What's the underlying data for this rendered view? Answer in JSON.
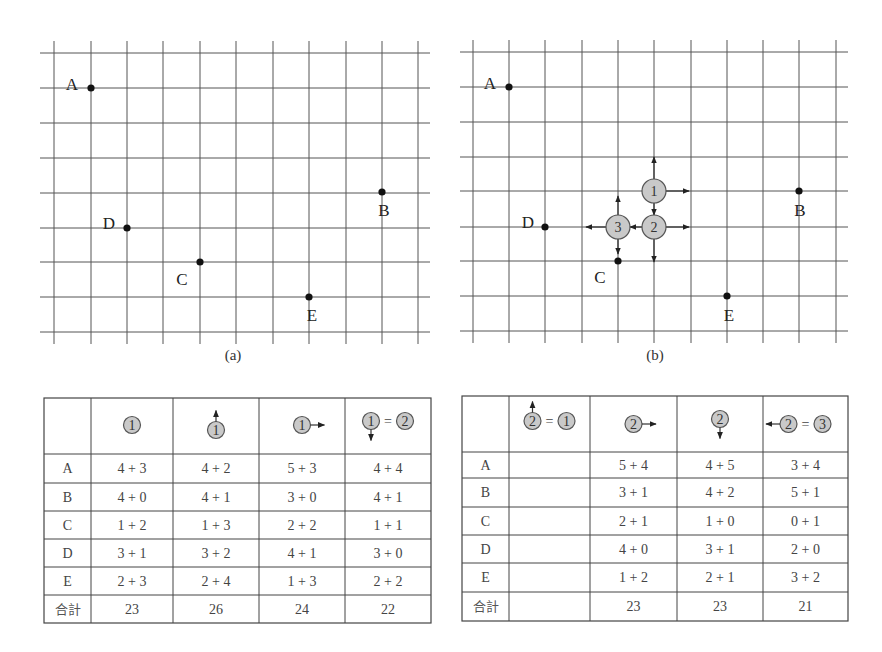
{
  "figure_a": {
    "caption": "(a)",
    "grid": {
      "x_lines": [
        54,
        91,
        127,
        163,
        200,
        236,
        273,
        309,
        346,
        382,
        418
      ],
      "y_lines": [
        53,
        88,
        123,
        158,
        193,
        228,
        262,
        297,
        332
      ],
      "x_start": 40,
      "x_end": 430,
      "y_start": 41,
      "y_end": 344
    },
    "points": [
      {
        "label": "A",
        "x": 91,
        "y": 88,
        "lx": -19,
        "ly": -4
      },
      {
        "label": "B",
        "x": 382,
        "y": 192,
        "lx": 2,
        "ly": 18
      },
      {
        "label": "C",
        "x": 200,
        "y": 262,
        "lx": -18,
        "ly": 17
      },
      {
        "label": "D",
        "x": 127,
        "y": 228,
        "lx": -18,
        "ly": -5
      },
      {
        "label": "E",
        "x": 309,
        "y": 297,
        "lx": 3,
        "ly": 18
      }
    ]
  },
  "figure_b": {
    "caption": "(b)",
    "grid": {
      "x_lines": [
        473,
        509,
        545,
        582,
        618,
        654,
        691,
        727,
        763,
        799,
        836
      ],
      "y_lines": [
        52,
        87,
        122,
        157,
        191,
        227,
        261,
        296,
        331
      ],
      "x_start": 460,
      "x_end": 848,
      "y_start": 40,
      "y_end": 343
    },
    "points": [
      {
        "label": "A",
        "x": 509,
        "y": 87,
        "lx": -19,
        "ly": -4
      },
      {
        "label": "B",
        "x": 799,
        "y": 191,
        "lx": 1,
        "ly": 19
      },
      {
        "label": "C",
        "x": 618,
        "y": 261,
        "lx": -18,
        "ly": 16
      },
      {
        "label": "D",
        "x": 545,
        "y": 227,
        "lx": -17,
        "ly": -5
      },
      {
        "label": "E",
        "x": 727,
        "y": 296,
        "lx": 2,
        "ly": 19
      }
    ],
    "candidates": [
      {
        "label": "1",
        "x": 654,
        "y": 191
      },
      {
        "label": "2",
        "x": 654,
        "y": 227
      },
      {
        "label": "3",
        "x": 618,
        "y": 227
      }
    ]
  },
  "table_left": {
    "corner": "",
    "headers": [
      {
        "circle": "1",
        "move": "none"
      },
      {
        "circle": "1",
        "move": "up"
      },
      {
        "circle": "1",
        "move": "right"
      },
      {
        "circle": "1",
        "move": "down",
        "equals": "2"
      }
    ],
    "rows": [
      {
        "label": "A",
        "cells": [
          "4+3",
          "4+2",
          "5+3",
          "4+4"
        ]
      },
      {
        "label": "B",
        "cells": [
          "4+0",
          "4+1",
          "3+0",
          "4+1"
        ]
      },
      {
        "label": "C",
        "cells": [
          "1+2",
          "1+3",
          "2+2",
          "1+1"
        ]
      },
      {
        "label": "D",
        "cells": [
          "3+1",
          "3+2",
          "4+1",
          "3+0"
        ]
      },
      {
        "label": "E",
        "cells": [
          "2+3",
          "2+4",
          "1+3",
          "2+2"
        ]
      }
    ],
    "total": {
      "label": "合計",
      "cells": [
        "23",
        "26",
        "24",
        "22"
      ]
    }
  },
  "table_right": {
    "corner": "",
    "headers": [
      {
        "circle": "2",
        "move": "up",
        "equals": "1"
      },
      {
        "circle": "2",
        "move": "right"
      },
      {
        "circle": "2",
        "move": "down"
      },
      {
        "circle": "2",
        "move": "left",
        "equals": "3"
      }
    ],
    "rows": [
      {
        "label": "A",
        "cells": [
          "",
          "5+4",
          "4+5",
          "3+4"
        ]
      },
      {
        "label": "B",
        "cells": [
          "",
          "3+1",
          "4+2",
          "5+1"
        ]
      },
      {
        "label": "C",
        "cells": [
          "",
          "2+1",
          "1+0",
          "0+1"
        ]
      },
      {
        "label": "D",
        "cells": [
          "",
          "4+0",
          "3+1",
          "2+0"
        ]
      },
      {
        "label": "E",
        "cells": [
          "",
          "1+2",
          "2+1",
          "3+2"
        ]
      }
    ],
    "total": {
      "label": "合計",
      "cells": [
        "",
        "23",
        "23",
        "21"
      ]
    }
  },
  "colors": {
    "circle_fill": "#c9c9c9",
    "grid_line": "#555555",
    "point": "#111111"
  }
}
